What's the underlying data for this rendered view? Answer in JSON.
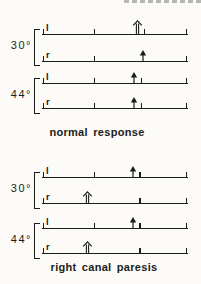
{
  "figure": {
    "ink": "#1c1c1c",
    "background": "#fcfbf8",
    "timeline": {
      "left": 42,
      "width": 146
    },
    "sections": [
      {
        "name": "normal-response",
        "caption": "normal response",
        "caption_box": {
          "left": 37,
          "top": 126,
          "width": 120
        },
        "blocks": [
          {
            "temperature": "30°",
            "label_box": {
              "left": 2,
              "top": 39,
              "width": 30
            },
            "bracket": {
              "left": 34,
              "top": 29,
              "height": 35
            },
            "rows": [
              {
                "ear": "l",
                "line_y": 34,
                "ticks_pct": [
                  1,
                  36,
                  70,
                  99
                ],
                "arrows": [
                  {
                    "pct": 65,
                    "style": "open",
                    "h": 14
                  }
                ]
              },
              {
                "ear": "r",
                "line_y": 61,
                "ticks_pct": [
                  1,
                  36,
                  99
                ],
                "arrows": [
                  {
                    "pct": 69,
                    "style": "solid",
                    "h": 11
                  }
                ]
              }
            ]
          },
          {
            "temperature": "44°",
            "label_box": {
              "left": 2,
              "top": 88,
              "width": 30
            },
            "bracket": {
              "left": 34,
              "top": 78,
              "height": 34
            },
            "rows": [
              {
                "ear": "l",
                "line_y": 83,
                "ticks_pct": [
                  1,
                  36,
                  68,
                  99
                ],
                "arrows": [
                  {
                    "pct": 63,
                    "style": "solid",
                    "h": 11
                  }
                ]
              },
              {
                "ear": "r",
                "line_y": 108,
                "ticks_pct": [
                  1,
                  36,
                  68,
                  99
                ],
                "arrows": [
                  {
                    "pct": 63,
                    "style": "solid",
                    "h": 11
                  }
                ]
              }
            ]
          }
        ]
      },
      {
        "name": "right-canal-paresis",
        "caption": "right canal paresis",
        "caption_box": {
          "left": 40,
          "top": 261,
          "width": 128
        },
        "blocks": [
          {
            "temperature": "30°",
            "label_box": {
              "left": 2,
              "top": 182,
              "width": 30
            },
            "bracket": {
              "left": 34,
              "top": 172,
              "height": 35
            },
            "rows": [
              {
                "ear": "l",
                "line_y": 177,
                "ticks_pct": [
                  1,
                  36,
                  67,
                  99
                ],
                "arrows": [
                  {
                    "pct": 62,
                    "style": "solid",
                    "h": 11
                  }
                ]
              },
              {
                "ear": "r",
                "line_y": 203,
                "ticks_pct": [
                  1,
                  67,
                  99
                ],
                "arrows": [
                  {
                    "pct": 31,
                    "style": "open",
                    "h": 12
                  }
                ]
              }
            ]
          },
          {
            "temperature": "44°",
            "label_box": {
              "left": 2,
              "top": 233,
              "width": 30
            },
            "bracket": {
              "left": 34,
              "top": 223,
              "height": 34
            },
            "rows": [
              {
                "ear": "l",
                "line_y": 228,
                "ticks_pct": [
                  1,
                  36,
                  67,
                  99
                ],
                "arrows": [
                  {
                    "pct": 62,
                    "style": "solid",
                    "h": 11
                  }
                ]
              },
              {
                "ear": "r",
                "line_y": 253,
                "ticks_pct": [
                  1,
                  67,
                  99
                ],
                "arrows": [
                  {
                    "pct": 31,
                    "style": "open",
                    "h": 12
                  }
                ]
              }
            ]
          }
        ]
      }
    ]
  }
}
